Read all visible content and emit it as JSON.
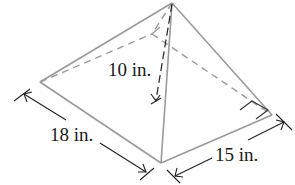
{
  "figure": {
    "type": "square-based pyramid (rectangular base)",
    "labels": {
      "height": "10 in.",
      "length": "18 in.",
      "width": "15 in."
    },
    "colors": {
      "edge": "#9a9a9a",
      "dimension": "#222222",
      "text": "#1a1a1a"
    }
  }
}
